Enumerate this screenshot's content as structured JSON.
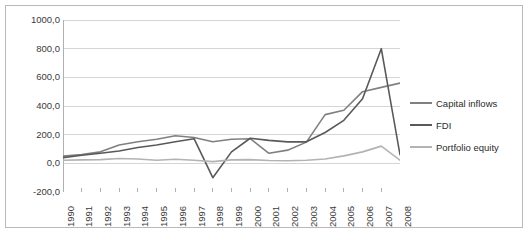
{
  "chart_data": {
    "type": "line",
    "title": "",
    "xlabel": "",
    "ylabel": "",
    "grid": true,
    "legend_position": "right",
    "ylim": [
      -200.0,
      1000.0
    ],
    "ytick_step": 200.0,
    "ytick_labels": [
      "1000,0",
      "800,0",
      "600,0",
      "400,0",
      "200,0",
      "0,0",
      "-200,0"
    ],
    "ytick_values": [
      1000.0,
      800.0,
      600.0,
      400.0,
      200.0,
      0.0,
      -200.0
    ],
    "categories": [
      "1990",
      "1991",
      "1992",
      "1993",
      "1994",
      "1995",
      "1996",
      "1997",
      "1998",
      "1999",
      "2000",
      "2001",
      "2002",
      "2003",
      "2004",
      "2005",
      "2006",
      "2007",
      "2008"
    ],
    "series": [
      {
        "name": "Capital inflows",
        "color": "#808080",
        "values": [
          50,
          62,
          80,
          128,
          150,
          168,
          192,
          180,
          150,
          168,
          172,
          70,
          92,
          148,
          340,
          370,
          500,
          530,
          560
        ]
      },
      {
        "name": "FDI",
        "color": "#595959",
        "values": [
          40,
          56,
          70,
          86,
          110,
          128,
          150,
          172,
          -100,
          80,
          175,
          160,
          150,
          150,
          215,
          300,
          450,
          800,
          60
        ]
      },
      {
        "name": "Portfolio equity",
        "color": "#b3b3b3",
        "values": [
          22,
          24,
          26,
          34,
          30,
          22,
          28,
          22,
          12,
          24,
          26,
          20,
          18,
          22,
          30,
          52,
          80,
          120,
          22
        ]
      }
    ]
  },
  "legend": {
    "items": [
      {
        "label": "Capital inflows",
        "color": "#808080"
      },
      {
        "label": "FDI",
        "color": "#595959"
      },
      {
        "label": "Portfolio equity",
        "color": "#b3b3b3"
      }
    ]
  }
}
